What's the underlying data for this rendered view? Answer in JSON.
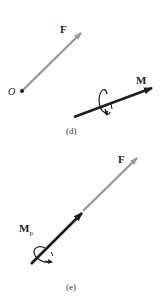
{
  "colors": {
    "force": "#9a9a9a",
    "moment": "#1e1e1e",
    "text": "#222222"
  },
  "panels": [
    {
      "caption": "(d)",
      "force": {
        "label": "F"
      },
      "point": {
        "label": "O"
      },
      "moment": {
        "label": "M"
      }
    },
    {
      "caption": "(e)",
      "force": {
        "label": "F"
      },
      "moment": {
        "label": "M",
        "subscript": "p"
      }
    }
  ]
}
